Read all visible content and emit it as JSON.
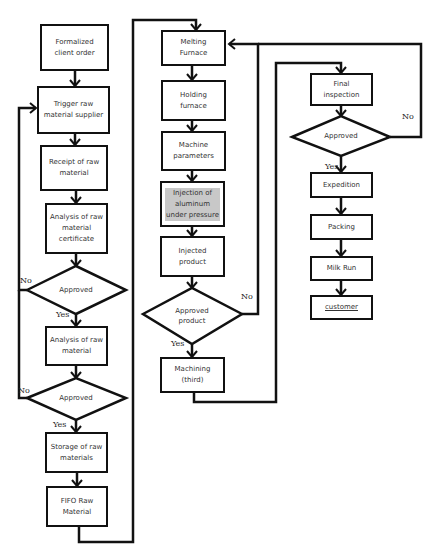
{
  "diagram": {
    "type": "flowchart",
    "nodes": {
      "client_order": "Formalized client order",
      "trigger_supplier": "Trigger raw material supplier",
      "receipt": "Receipt of raw material",
      "analysis_cert": "Analysis of raw material certificate",
      "approved_1": "Approved",
      "analysis_raw": "Analysis of raw material",
      "approved_2": "Approved",
      "storage": "Storage of raw materials",
      "fifo": "FIFO Raw Material",
      "melting": "Melting Furnace",
      "holding": "Holding furnace",
      "machine_params": "Machine parameters",
      "injection": "Injection of aluminum under pressure",
      "injected": "Injected product",
      "approved_product": "Approved product",
      "machining": "Machining (third)",
      "final_inspection": "Final inspection",
      "approved_final": "Approved",
      "expedition": "Expedition",
      "packing": "Packing",
      "milk_run": "Milk Run",
      "customer": "customer"
    },
    "edge_labels": {
      "yes": "Yes",
      "no": "No"
    },
    "edges": [
      [
        "client_order",
        "trigger_supplier"
      ],
      [
        "trigger_supplier",
        "receipt"
      ],
      [
        "receipt",
        "analysis_cert"
      ],
      [
        "analysis_cert",
        "approved_1"
      ],
      [
        "approved_1",
        "analysis_raw",
        "Yes"
      ],
      [
        "approved_1",
        "trigger_supplier",
        "No"
      ],
      [
        "analysis_raw",
        "approved_2"
      ],
      [
        "approved_2",
        "storage",
        "Yes"
      ],
      [
        "approved_2",
        "trigger_supplier",
        "No"
      ],
      [
        "storage",
        "fifo"
      ],
      [
        "fifo",
        "melting"
      ],
      [
        "melting",
        "holding"
      ],
      [
        "holding",
        "machine_params"
      ],
      [
        "machine_params",
        "injection"
      ],
      [
        "injection",
        "injected"
      ],
      [
        "injected",
        "approved_product"
      ],
      [
        "approved_product",
        "machining",
        "Yes"
      ],
      [
        "approved_product",
        "melting",
        "No"
      ],
      [
        "machining",
        "final_inspection"
      ],
      [
        "final_inspection",
        "approved_final"
      ],
      [
        "approved_final",
        "expedition",
        "Yes"
      ],
      [
        "approved_final",
        "melting",
        "No"
      ],
      [
        "expedition",
        "packing"
      ],
      [
        "packing",
        "milk_run"
      ],
      [
        "milk_run",
        "customer"
      ]
    ]
  }
}
